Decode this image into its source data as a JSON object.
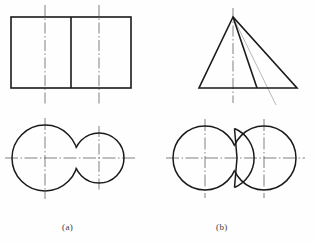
{
  "figure": {
    "kind": "engineering-drawing",
    "line_colors": {
      "outline": "#1a1a1a",
      "centerline": "#4a4a4a",
      "thin_construction": "#7a7a7a",
      "background": "#fefefe"
    },
    "line_weights": {
      "outline": 1.5,
      "centerline": 0.7,
      "thin_construction": 0.6
    },
    "captions": [
      {
        "id": "a",
        "label": "(a)"
      },
      {
        "id": "b",
        "label": "(b)"
      }
    ],
    "panels": [
      {
        "id": "a",
        "caption": "(a)",
        "front_view": {
          "shape": "rectangle-divided",
          "x": 11,
          "y": 17,
          "width": 120,
          "height": 71,
          "divider_x": 71,
          "centerlines_x": [
            45,
            99
          ]
        },
        "top_view": {
          "shape": "two-tangent-circles",
          "circles": [
            {
              "cx": 45,
              "cy": 158,
              "r": 33
            },
            {
              "cx": 99,
              "cy": 158,
              "r": 25
            }
          ],
          "horizontal_centerline_y": 158,
          "vertical_centerlines_x": [
            45,
            99
          ]
        }
      },
      {
        "id": "b",
        "caption": "(b)",
        "front_view": {
          "shape": "triangle-with-internal-edges",
          "apex": {
            "x": 233,
            "y": 17
          },
          "base_left": {
            "x": 199,
            "y": 88
          },
          "base_right": {
            "x": 297,
            "y": 88
          },
          "internal_solid_edge": {
            "x": 257,
            "y": 88
          },
          "construction_line_end": {
            "x": 276,
            "y": 105
          },
          "centerline_x": 233
        },
        "top_view": {
          "shape": "two-overlapping-circles-with-wedge",
          "circles": [
            {
              "cx": 205,
              "cy": 158,
              "r": 32
            },
            {
              "cx": 264,
              "cy": 158,
              "r": 32
            }
          ],
          "wedge_apex": {
            "x": 237,
            "y": 158
          },
          "horizontal_centerline_y": 158,
          "vertical_centerlines_x": [
            205,
            264
          ]
        }
      }
    ]
  }
}
